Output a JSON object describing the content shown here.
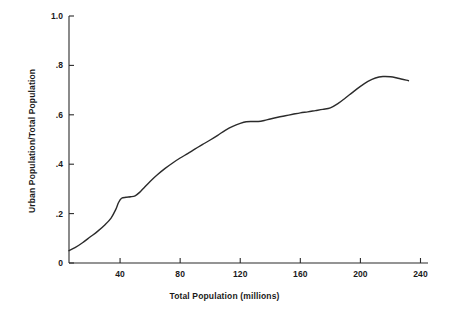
{
  "chart_data": {
    "type": "line",
    "title": "",
    "xlabel": "Total Population (millions)",
    "ylabel": "Urban Population/Total Population",
    "xlim": [
      6,
      245
    ],
    "ylim": [
      0,
      1.0
    ],
    "xticks": [
      40,
      80,
      120,
      160,
      200,
      240
    ],
    "xtick_labels": [
      "40",
      "80",
      "120",
      "160",
      "200",
      "240"
    ],
    "yticks": [
      0,
      0.2,
      0.4,
      0.6,
      0.8,
      1.0
    ],
    "ytick_labels": [
      "0",
      ".2",
      ".4",
      ".6",
      ".8",
      "1.0"
    ],
    "grid": false,
    "legend": "none",
    "line_color": "#2b2b2b",
    "line_width": 1.4,
    "series": [
      {
        "name": "Urbanization ratio",
        "x": [
          6,
          10,
          15,
          20,
          25,
          30,
          34,
          37,
          39,
          41,
          44,
          47,
          50,
          53,
          56,
          60,
          65,
          70,
          75,
          80,
          85,
          90,
          95,
          100,
          105,
          110,
          115,
          120,
          124,
          128,
          132,
          136,
          140,
          145,
          150,
          155,
          160,
          165,
          170,
          175,
          180,
          185,
          190,
          195,
          200,
          205,
          210,
          215,
          220,
          225,
          232
        ],
        "y": [
          0.05,
          0.062,
          0.082,
          0.105,
          0.128,
          0.155,
          0.182,
          0.215,
          0.245,
          0.262,
          0.266,
          0.268,
          0.272,
          0.286,
          0.305,
          0.33,
          0.358,
          0.383,
          0.405,
          0.425,
          0.443,
          0.462,
          0.48,
          0.498,
          0.517,
          0.537,
          0.553,
          0.565,
          0.572,
          0.573,
          0.573,
          0.577,
          0.583,
          0.59,
          0.596,
          0.602,
          0.608,
          0.612,
          0.617,
          0.622,
          0.628,
          0.645,
          0.668,
          0.692,
          0.715,
          0.735,
          0.749,
          0.755,
          0.754,
          0.748,
          0.738
        ]
      }
    ]
  },
  "axes": {
    "y_title": "Urban Population/Total Population",
    "x_title": "Total Population (millions)"
  }
}
